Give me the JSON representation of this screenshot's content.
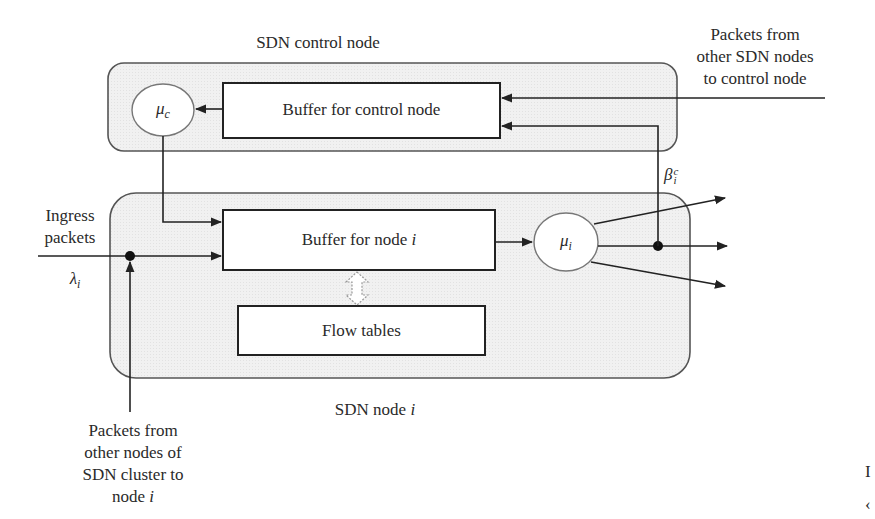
{
  "diagram": {
    "control_group": {
      "title": "SDN control node",
      "server_label": "μ",
      "server_sub": "c",
      "buffer_label": "Buffer for control node"
    },
    "node_group": {
      "title_prefix": "SDN node ",
      "title_var": "i",
      "buffer_label_prefix": "Buffer for node ",
      "buffer_label_var": "i",
      "flow_tables_label": "Flow tables",
      "server_label": "μ",
      "server_sub": "i"
    },
    "inputs": {
      "ingress_line1": "Ingress",
      "ingress_line2": "packets",
      "lambda_symbol": "λ",
      "lambda_sub": "i",
      "external_control_line1": "Packets from",
      "external_control_line2": "other SDN nodes",
      "external_control_line3": "to control node",
      "cluster_line1": "Packets from",
      "cluster_line2": "other nodes of",
      "cluster_line3": "SDN cluster to",
      "cluster_line4_prefix": "node ",
      "cluster_line4_var": "i"
    },
    "outputs": {
      "beta_symbol": "β",
      "beta_sub": "i",
      "beta_sup": "c",
      "branch_count": 3
    },
    "cutoff_edge": {
      "char1": "I",
      "char2": "‹"
    },
    "colors": {
      "group_fill": "#efefef",
      "group_stroke": "#555555",
      "line": "#222222",
      "box_fill": "#ffffff"
    }
  }
}
